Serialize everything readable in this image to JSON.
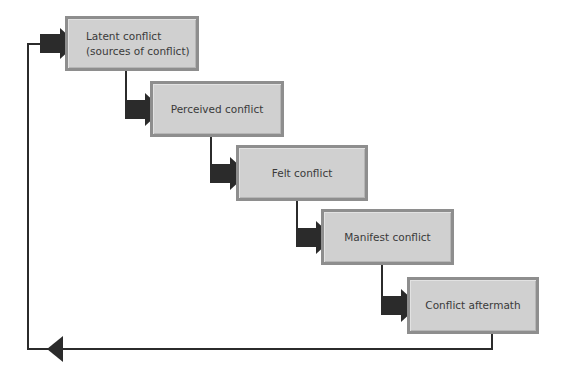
{
  "diagram": {
    "title": "",
    "stages": [
      {
        "id": "latent",
        "label": "Latent conflict\n(sources of conflict)"
      },
      {
        "id": "perceived",
        "label": "Perceived conflict"
      },
      {
        "id": "felt",
        "label": "Felt conflict"
      },
      {
        "id": "manifest",
        "label": "Manifest conflict"
      },
      {
        "id": "aftermath",
        "label": "Conflict aftermath"
      }
    ],
    "flow": [
      {
        "from": "latent",
        "to": "perceived",
        "type": "thick-arrow"
      },
      {
        "from": "perceived",
        "to": "felt",
        "type": "thick-arrow"
      },
      {
        "from": "felt",
        "to": "manifest",
        "type": "thick-arrow"
      },
      {
        "from": "manifest",
        "to": "aftermath",
        "type": "thick-arrow"
      },
      {
        "from": "aftermath",
        "to": "latent",
        "type": "feedback-loop"
      }
    ],
    "colors": {
      "box_fill": "#d0d0d0",
      "box_border": "#8e8e8e",
      "arrow": "#2b2b2b",
      "line": "#2b2b2b",
      "text": "#3a3a3a"
    }
  }
}
